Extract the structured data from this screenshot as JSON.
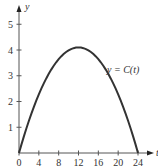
{
  "chart_data": {
    "type": "line",
    "title": "",
    "xlabel": "t",
    "ylabel": "y",
    "xlim": [
      0,
      24
    ],
    "ylim": [
      0,
      5
    ],
    "x_ticks": [
      0,
      4,
      8,
      12,
      16,
      20,
      24
    ],
    "y_ticks": [
      1,
      2,
      3,
      4,
      5
    ],
    "x_tick_labels": [
      "0",
      "4",
      "8",
      "12",
      "16",
      "20",
      "24"
    ],
    "y_tick_labels": [
      "1",
      "2",
      "3",
      "4",
      "5"
    ],
    "grid": false,
    "legend": null,
    "annotations": [
      {
        "text": "y = C(t)",
        "x": 16.5,
        "y": 3.5
      }
    ],
    "series": [
      {
        "name": "y = C(t)",
        "x": [
          0,
          2,
          4,
          6,
          8,
          10,
          12,
          14,
          16,
          18,
          20,
          22,
          24
        ],
        "values": [
          0,
          1.25,
          2.28,
          3.08,
          3.65,
          3.99,
          4.1,
          3.99,
          3.65,
          3.08,
          2.28,
          1.25,
          0
        ]
      }
    ]
  },
  "labels": {
    "x_axis": "t",
    "y_axis": "y",
    "curve": "y = C(t)"
  }
}
